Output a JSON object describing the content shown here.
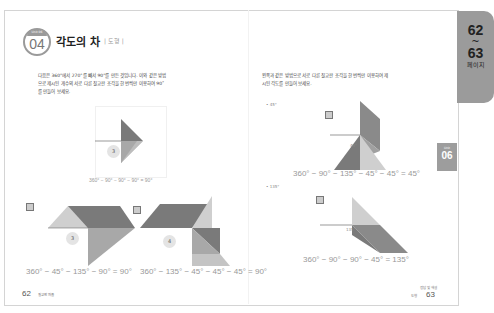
{
  "header": {
    "unit_label": "Unit 06",
    "unit_number": "04",
    "title": "각도의 차",
    "subtitle": "| 도형 |"
  },
  "left_page": {
    "instruction_lines": [
      "다음은 360°에서 270°를 빼서 90°를 만든 것입니다. 이와 같은 방법",
      "으로 제시된 개수의 서로 다른 칠교판 조각을 한 번씩만 이용하여 90˚",
      "를 만들어 보세요."
    ],
    "example": {
      "piece_count": "3",
      "equation": "360° − 90° − 90° − 90° = 90°"
    },
    "answers": [
      {
        "marker": "예",
        "piece_count": "3",
        "equation": "360° − 45° − 135° − 90° = 90°"
      },
      {
        "marker": "예",
        "piece_count": "4",
        "equation": "360° − 135° − 45° − 45° − 45° = 90°"
      }
    ],
    "folio": {
      "page": "62",
      "label": "칠교판 퍼즐"
    }
  },
  "right_page": {
    "instruction_lines": [
      "왼쪽과 같은 방법으로 서로 다른 칠교판 조각을 한 번씩만 이용하여 제",
      "시된 각도를 만들어 보세요."
    ],
    "problems": [
      {
        "target": "• 45°",
        "marker": "예",
        "angle_label": "45°",
        "equation": "360° − 90° − 135° − 45° − 45° = 45°"
      },
      {
        "target": "• 135°",
        "marker": "예",
        "angle_label": "135°",
        "equation": "360° − 90° − 90° − 45° = 135°"
      }
    ],
    "folio": {
      "page": "63",
      "label_top": "정답 및 해설",
      "label": "도형"
    }
  },
  "side_tabs": {
    "page_range_start": "62",
    "page_range_tilde": "~",
    "page_range_end": "63",
    "page_word": "페이지",
    "unit_tab_label": "Unit",
    "unit_tab_number": "06"
  },
  "colors": {
    "tab_gray": "#9b9b9b",
    "piece_dark": "#7a7a7a",
    "piece_mid": "#a8a8a8",
    "piece_light": "#cfcfcf"
  }
}
